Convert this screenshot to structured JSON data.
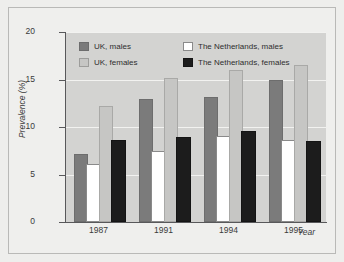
{
  "chart_data": {
    "type": "bar",
    "title": "",
    "xlabel": "Year",
    "ylabel": "Prevalence (%)",
    "categories": [
      "1987",
      "1991",
      "1994",
      "1995"
    ],
    "ylim": [
      0,
      20
    ],
    "yticks": [
      0,
      5,
      10,
      15,
      20
    ],
    "grid": true,
    "legend_position": "top-left-inside",
    "series": [
      {
        "name": "UK, males",
        "color": "#7b7b7b",
        "values": [
          7.0,
          12.7,
          13.0,
          14.7
        ]
      },
      {
        "name": "UK, females",
        "color": "#c6c6c4",
        "values": [
          12.0,
          15.0,
          15.8,
          16.3
        ]
      },
      {
        "name": "The Netherlands, males",
        "color": "#ffffff",
        "values": [
          5.9,
          7.3,
          8.8,
          8.4
        ]
      },
      {
        "name": "The Netherlands, females",
        "color": "#1c1c1c",
        "values": [
          8.4,
          8.7,
          9.4,
          8.3
        ]
      }
    ]
  },
  "axes": {
    "y_tick_labels": [
      "20",
      "15",
      "10",
      "5",
      "0"
    ],
    "x_tick_labels": [
      "1987",
      "1991",
      "1994",
      "1995"
    ],
    "y_axis_title": "Prevalence (%)",
    "x_axis_title": "Year"
  },
  "legend": {
    "entries": [
      {
        "label": "UK, males",
        "swatch": "uk-m"
      },
      {
        "label": "The Netherlands, males",
        "swatch": "nl-m"
      },
      {
        "label": "UK, females",
        "swatch": "uk-f"
      },
      {
        "label": "The Netherlands, females",
        "swatch": "nl-f"
      }
    ]
  },
  "colors": {
    "uk_males": "#7b7b7b",
    "uk_females": "#c6c6c4",
    "nl_males": "#ffffff",
    "nl_females": "#1c1c1c",
    "plot_background": "#d3d3d1",
    "page_background": "#eeeeec",
    "gridline": "#f2f2f0",
    "axis": "#58585a"
  }
}
